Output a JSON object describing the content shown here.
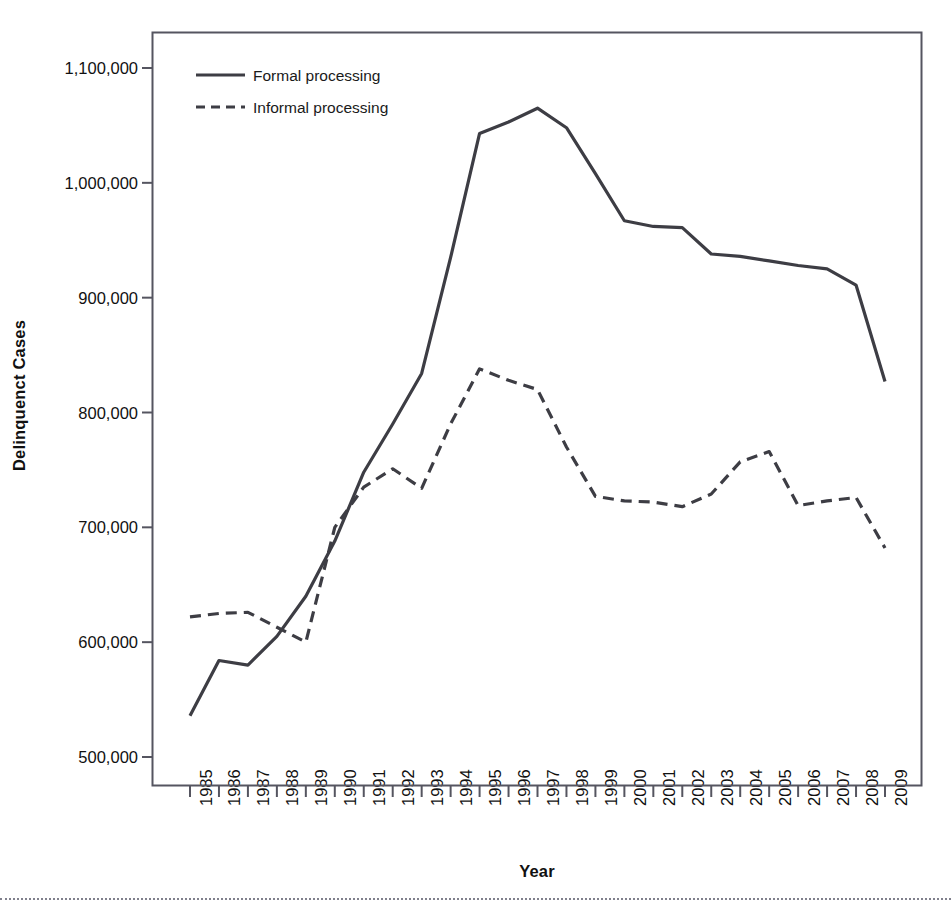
{
  "chart_data": {
    "type": "line",
    "title": "",
    "xlabel": "Year",
    "ylabel": "Delinquenct Cases",
    "x": [
      1985,
      1986,
      1987,
      1988,
      1989,
      1990,
      1991,
      1992,
      1993,
      1994,
      1995,
      1996,
      1997,
      1998,
      1999,
      2000,
      2001,
      2002,
      2003,
      2004,
      2005,
      2006,
      2007,
      2008,
      2009
    ],
    "categories": [
      "1985",
      "1986",
      "1987",
      "1988",
      "1989",
      "1990",
      "1991",
      "1992",
      "1993",
      "1994",
      "1995",
      "1996",
      "1997",
      "1998",
      "1999",
      "2000",
      "2001",
      "2002",
      "2003",
      "2004",
      "2005",
      "2006",
      "2007",
      "2008",
      "2009"
    ],
    "series": [
      {
        "name": "Formal processing",
        "style": "solid",
        "color": "#3d3d44",
        "values": [
          536000,
          584000,
          580000,
          605000,
          640000,
          688000,
          748000,
          790000,
          834000,
          935000,
          1043000,
          1053000,
          1065000,
          1048000,
          1008000,
          967000,
          962000,
          961000,
          938000,
          936000,
          932000,
          928000,
          925000,
          911000,
          827000
        ]
      },
      {
        "name": "Informal processing",
        "style": "dashed",
        "color": "#3d3d44",
        "values": [
          622000,
          625000,
          626000,
          613000,
          600000,
          700000,
          735000,
          751000,
          734000,
          790000,
          838000,
          828000,
          820000,
          770000,
          727000,
          723000,
          722000,
          718000,
          729000,
          757000,
          766000,
          719000,
          723000,
          726000,
          682000
        ]
      }
    ],
    "ylim": [
      480000,
      1135000
    ],
    "yticks": [
      500000,
      600000,
      700000,
      800000,
      900000,
      1000000,
      1100000
    ],
    "ytick_labels": [
      "500,000",
      "600,000",
      "700,000",
      "800,000",
      "900,000",
      "1,000,000",
      "1,100,000"
    ],
    "grid": false,
    "legend_position": "top-left-inside",
    "legend_entries": [
      "Formal processing",
      "Informal processing"
    ]
  },
  "axes": {
    "frame_color": "#555560",
    "tick_color": "#555560"
  }
}
